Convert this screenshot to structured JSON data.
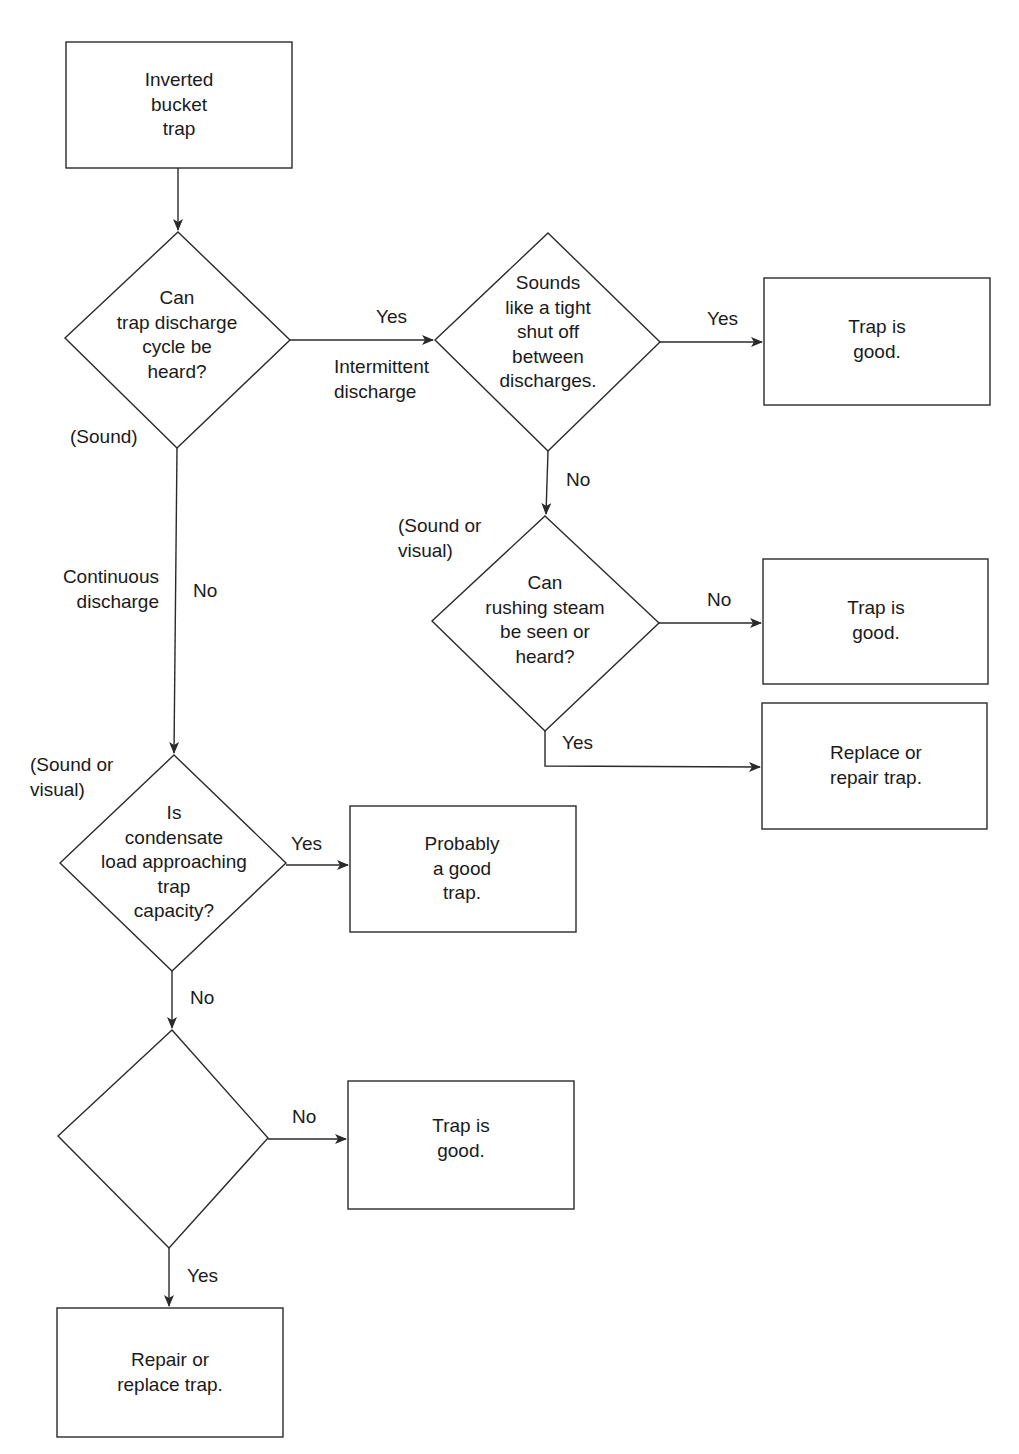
{
  "nodes": {
    "start": {
      "text": "Inverted\nbucket\ntrap"
    },
    "q_cycle_heard": {
      "text": "Can\ntrap discharge\ncycle be\nheard?"
    },
    "q_tight_shutoff": {
      "text": "Sounds\nlike a tight\nshut off\nbetween\ndischarges."
    },
    "r_good_1": {
      "text": "Trap is\ngood."
    },
    "q_steam_seen_heard": {
      "text": "Can\nrushing steam\nbe seen or\nheard?"
    },
    "r_good_2": {
      "text": "Trap is\ngood."
    },
    "r_replace_repair": {
      "text": "Replace or\nrepair trap."
    },
    "q_condensate_load": {
      "text": "Is\ncondensate\nload approaching\ntrap\ncapacity?"
    },
    "r_probably_good": {
      "text": "Probably\na good\ntrap."
    },
    "q_steam_heard_seen": {
      "text": "Can\nrushing steam\nbe heard\nor seen?"
    },
    "r_good_3": {
      "text": "Trap is\ngood."
    },
    "r_repair_replace": {
      "text": "Repair or\nreplace trap."
    }
  },
  "labels": {
    "yes_intermittent": "Yes",
    "intermittent_discharge": "Intermittent\ndischarge",
    "sound_1": "(Sound)",
    "yes_tight": "Yes",
    "no_tight": "No",
    "sound_or_visual_1": "(Sound or\nvisual)",
    "no_steam_1": "No",
    "yes_steam_1": "Yes",
    "continuous_discharge": "Continuous\ndischarge",
    "no_cycle": "No",
    "sound_or_visual_2": "(Sound or\nvisual)",
    "yes_condensate": "Yes",
    "no_condensate": "No",
    "no_steam_2": "No",
    "yes_steam_2": "Yes"
  },
  "colors": {
    "line": "#2a2a2a",
    "background": "#ffffff",
    "text": "#1a1a1a"
  }
}
